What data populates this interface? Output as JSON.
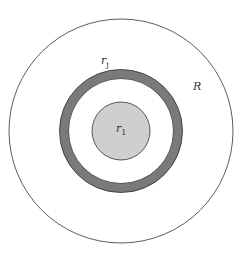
{
  "diagram": {
    "labels": {
      "outer_radius": "R",
      "ring_radius": "r",
      "ring_radius_sub": "j",
      "core_radius": "r",
      "core_radius_sub": "1"
    },
    "colors": {
      "background": "#ffffff",
      "outline": "#333333",
      "ring_fill": "#7a7a7a",
      "core_fill": "#cfcfcf"
    }
  }
}
